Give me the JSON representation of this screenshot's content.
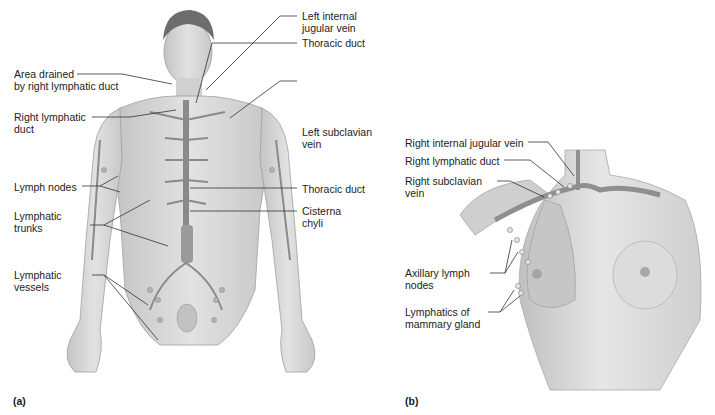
{
  "figure": {
    "panels": [
      {
        "tag": "(a)",
        "subject": "male-full-body-lymphatic-system",
        "labels": {
          "area_drained": "Area drained\nby right lymphatic duct",
          "right_lymphatic_duct": "Right lymphatic\nduct",
          "lymph_nodes": "Lymph nodes",
          "lymphatic_trunks": "Lymphatic\ntrunks",
          "lymphatic_vessels": "Lymphatic\nvessels",
          "left_internal_jugular_vein": "Left internal\njugular vein",
          "thoracic_duct_upper": "Thoracic duct",
          "left_subclavian_vein": "Left subclavian\nvein",
          "thoracic_duct_lower": "Thoracic duct",
          "cisterna_chyli": "Cisterna\nchyli"
        }
      },
      {
        "tag": "(b)",
        "subject": "female-chest-mammary-lymphatics",
        "labels": {
          "right_internal_jugular_vein": "Right internal jugular vein",
          "right_lymphatic_duct": "Right lymphatic duct",
          "right_subclavian_vein": "Right subclavian\nvein",
          "axillary_lymph_nodes": "Axillary lymph\nnodes",
          "lymphatics_of_mammary_gland": "Lymphatics of\nmammary gland"
        }
      }
    ],
    "colors": {
      "background": "#ffffff",
      "skin": "#d9d9d9",
      "skin_shade": "#bdbdbd",
      "vessel": "#8a8a8a",
      "leader_line": "#333333",
      "text": "#1c1c1c"
    }
  }
}
